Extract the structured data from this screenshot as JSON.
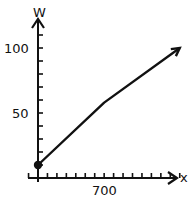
{
  "chart_data": {
    "type": "line",
    "title": "",
    "xlabel": "x",
    "ylabel": "W",
    "x": [
      0,
      700,
      1500
    ],
    "series": [
      {
        "name": "W",
        "values": [
          10,
          58,
          100
        ]
      }
    ],
    "x_ticks_labeled": [
      {
        "value": 700,
        "label": "700"
      }
    ],
    "y_ticks_labeled": [
      {
        "value": 50,
        "label": "50"
      },
      {
        "value": 100,
        "label": "100"
      }
    ],
    "x_tick_step": 100,
    "y_tick_step": 10,
    "xlim": [
      0,
      1500
    ],
    "ylim": [
      0,
      110
    ],
    "grid": false,
    "legend": null,
    "annotations": [
      "start point marked with filled dot",
      "line ends with arrowhead"
    ]
  },
  "labels": {
    "y_axis": "W",
    "x_axis": "x",
    "y100": "100",
    "y50": "50",
    "x700": "700"
  },
  "colors": {
    "line": "#111111",
    "axis": "#111111"
  }
}
